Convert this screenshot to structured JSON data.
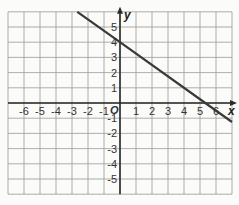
{
  "chart_data": {
    "type": "line",
    "title": "",
    "xlabel": "x",
    "ylabel": "y",
    "origin_label": "O",
    "xlim": [
      -7,
      7
    ],
    "ylim": [
      -6,
      6
    ],
    "grid": true,
    "x_ticks": [
      "-6",
      "-5",
      "-4",
      "-3",
      "-2",
      "-1",
      "1",
      "2",
      "3",
      "4",
      "5",
      "6"
    ],
    "y_ticks": [
      "5",
      "4",
      "3",
      "2",
      "1",
      "-1",
      "-2",
      "-3",
      "-4",
      "-5"
    ],
    "series": [
      {
        "name": "line",
        "equation": "y = -0.75x + 4",
        "x": [
          -2.67,
          0,
          5.33,
          7
        ],
        "y": [
          6,
          4,
          0,
          -1.25
        ],
        "color": "#3a3a3a"
      }
    ],
    "colors": {
      "grid": "#9a9a9a",
      "axis": "#2a2a2a",
      "background": "#fbfbf9"
    }
  }
}
